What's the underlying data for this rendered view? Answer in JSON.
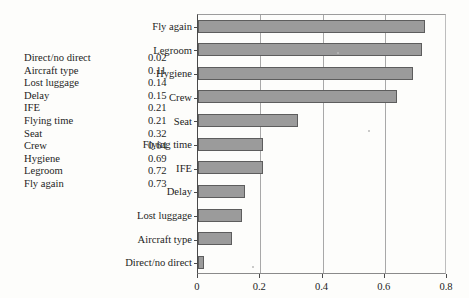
{
  "chart_data": {
    "type": "bar",
    "orientation": "horizontal",
    "title": "",
    "xlabel": "",
    "ylabel": "",
    "categories": [
      "Fly again",
      "Legroom",
      "Hygiene",
      "Crew",
      "Seat",
      "Flying time",
      "IFE",
      "Delay",
      "Lost luggage",
      "Aircraft type",
      "Direct/no direct"
    ],
    "values": [
      0.73,
      0.72,
      0.69,
      0.64,
      0.32,
      0.21,
      0.21,
      0.15,
      0.14,
      0.11,
      0.02
    ],
    "xlim": [
      0,
      0.8
    ],
    "xticks": [
      "0",
      "0.2",
      "0.4",
      "0.6",
      "0.8"
    ],
    "xtick_values": [
      0,
      0.2,
      0.4,
      0.6,
      0.8
    ],
    "grid": "vertical",
    "legend": "none",
    "bar_color": "#9b9b9b",
    "bar_border_color": "#5d5d5d"
  },
  "table": {
    "rows": [
      {
        "name": "Direct/no direct",
        "value": "0.02"
      },
      {
        "name": "Aircraft type",
        "value": "0.11"
      },
      {
        "name": "Lost luggage",
        "value": "0.14"
      },
      {
        "name": "Delay",
        "value": "0.15"
      },
      {
        "name": "IFE",
        "value": "0.21"
      },
      {
        "name": "Flying time",
        "value": "0.21"
      },
      {
        "name": "Seat",
        "value": "0.32"
      },
      {
        "name": "Crew",
        "value": "0.64"
      },
      {
        "name": "Hygiene",
        "value": "0.69"
      },
      {
        "name": "Legroom",
        "value": "0.72"
      },
      {
        "name": "Fly again",
        "value": "0.73"
      }
    ]
  }
}
